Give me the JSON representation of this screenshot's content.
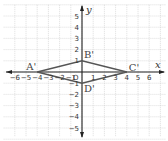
{
  "diagram": {
    "type": "coordinate-plane",
    "axes": {
      "x_label": "x",
      "y_label": "y",
      "origin_label": "O"
    },
    "x_ticks": [
      "-6",
      "-5",
      "-4",
      "-3",
      "-2",
      "-1",
      "1",
      "2",
      "3",
      "4",
      "5",
      "6"
    ],
    "y_ticks": [
      "5",
      "4",
      "3",
      "2",
      "1",
      "-1",
      "-2",
      "-3",
      "-4",
      "-5"
    ],
    "points": [
      {
        "label": "A'",
        "x": -4,
        "y": 0
      },
      {
        "label": "B'",
        "x": 0,
        "y": 1
      },
      {
        "label": "C'",
        "x": 4,
        "y": 0
      },
      {
        "label": "D'",
        "x": 0,
        "y": -1
      }
    ],
    "polygon": [
      "A'",
      "B'",
      "C'",
      "D'"
    ],
    "colors": {
      "grid": "#c8c8c8",
      "axis": "#222222",
      "shape": "#555555"
    }
  }
}
